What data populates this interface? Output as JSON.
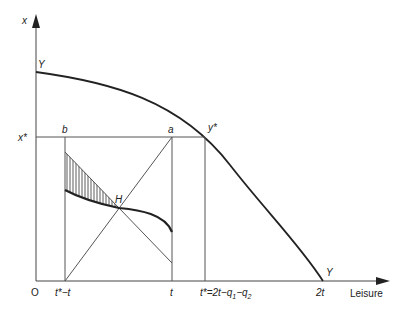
{
  "diagram": {
    "type": "economics-production-possibility",
    "axes": {
      "y_label": "x",
      "x_label": "Leisure",
      "origin_label": "O"
    },
    "curve_labels": {
      "ppf_top": "Y",
      "ppf_bottom": "Y",
      "tangent_point": "y*",
      "intersection": "H"
    },
    "y_ticks": {
      "x_star": "x*"
    },
    "x_ticks": {
      "t_star_minus_t": "t*−t",
      "t": "t",
      "t_star_eq_prefix": "t*=2t−q",
      "t_star_sub1": "1",
      "t_star_mid": "−q",
      "t_star_sub2": "2",
      "two_t": "2t"
    },
    "corner_labels": {
      "b": "b",
      "a": "a"
    },
    "colors": {
      "line": "#222222",
      "thin_line": "#555555",
      "background": "#ffffff"
    }
  }
}
